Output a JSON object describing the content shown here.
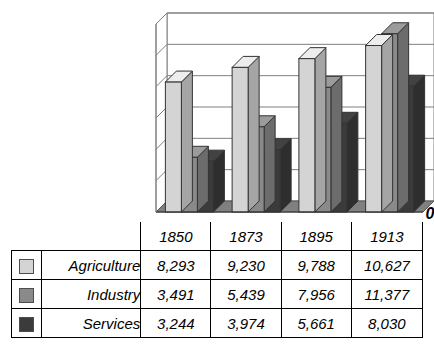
{
  "chart_data": {
    "type": "bar",
    "title": "",
    "xlabel": "",
    "ylabel": "",
    "categories": [
      "1850",
      "1873",
      "1895",
      "1913"
    ],
    "series": [
      {
        "name": "Agriculture",
        "values": [
          8293,
          9230,
          9788,
          10627
        ],
        "color": "#d4d4d4"
      },
      {
        "name": "Industry",
        "values": [
          3491,
          5439,
          7956,
          11377
        ],
        "color": "#8a8a8a"
      },
      {
        "name": "Services",
        "values": [
          3244,
          3974,
          5661,
          8030
        ],
        "color": "#3b3b3b"
      }
    ],
    "ylim": [
      0,
      12000
    ],
    "ytick_step": 2000,
    "yticks": [
      "0",
      "2,000",
      "4,000",
      "6,000",
      "8,000",
      "10,000",
      "12,000"
    ],
    "grid": true,
    "legend_position": "table",
    "three_d": true
  },
  "table": {
    "header": [
      "",
      "",
      "1850",
      "1873",
      "1895",
      "1913"
    ],
    "rows": [
      {
        "name": "Agriculture",
        "swatch_color": "#d4d4d4",
        "values": [
          "8,293",
          "9,230",
          "9,788",
          "10,627"
        ]
      },
      {
        "name": "Industry",
        "swatch_color": "#8a8a8a",
        "values": [
          "3,491",
          "5,439",
          "7,956",
          "11,377"
        ]
      },
      {
        "name": "Services",
        "swatch_color": "#3b3b3b",
        "values": [
          "3,244",
          "3,974",
          "5,661",
          "8,030"
        ]
      }
    ]
  },
  "axis": {
    "labels": [
      "12,000",
      "10,000",
      "8,000",
      "6,000",
      "4,000",
      "2,000",
      "0"
    ]
  }
}
